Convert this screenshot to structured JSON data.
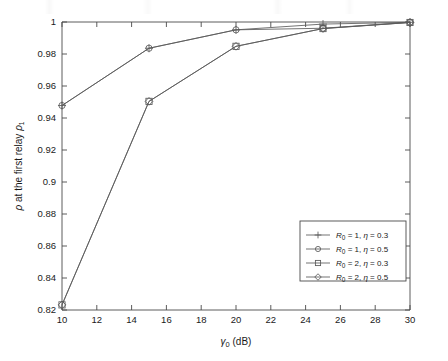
{
  "chart_data": {
    "type": "line",
    "title": "",
    "subtitle": "",
    "xlabel": "γ₀ (dB)",
    "xlabel_symbol": "γ",
    "xlabel_sub": "0",
    "xlabel_unit": "(dB)",
    "ylabel": "ρ at the first relay ρ₁",
    "ylabel_symbol": "ρ",
    "ylabel_text": " at the first relay ",
    "ylabel_symbol2": "ρ",
    "ylabel_sub2": "1",
    "xlim": [
      10,
      30
    ],
    "ylim": [
      0.82,
      1.0
    ],
    "xticks": [
      10,
      12,
      14,
      16,
      18,
      20,
      22,
      24,
      26,
      28,
      30
    ],
    "yticks": [
      0.82,
      0.84,
      0.86,
      0.88,
      0.9,
      0.92,
      0.94,
      0.96,
      0.98,
      1
    ],
    "xticklabels": [
      "10",
      "12",
      "14",
      "16",
      "18",
      "20",
      "22",
      "24",
      "26",
      "28",
      "30"
    ],
    "yticklabels": [
      "0.82",
      "0.84",
      "0.86",
      "0.88",
      "0.9",
      "0.92",
      "0.94",
      "0.96",
      "0.98",
      "1"
    ],
    "grid": false,
    "legend_position": "lower right",
    "line_color": "#5a5a5a",
    "x": [
      10,
      15,
      20,
      25,
      30
    ],
    "series": [
      {
        "name": "R_0 = 1, η = 0.3",
        "marker": "plus",
        "values": [
          0.9478,
          0.9836,
          0.9951,
          0.9987,
          0.9998
        ]
      },
      {
        "name": "R_0 = 1, η = 0.5",
        "marker": "circle",
        "values": [
          0.9478,
          0.9836,
          0.9951,
          0.9961,
          0.9998
        ]
      },
      {
        "name": "R_0 = 2, η = 0.3",
        "marker": "square",
        "values": [
          0.8232,
          0.9504,
          0.9848,
          0.9959,
          0.9997
        ]
      },
      {
        "name": "R_0 = 2, η = 0.5",
        "marker": "diamond",
        "values": [
          0.8232,
          0.9504,
          0.9848,
          0.9959,
          0.9997
        ]
      }
    ],
    "legend": [
      {
        "label_prefix": "R",
        "label_sub": "0",
        "label_mid": " = 1, ",
        "label_eta": "η",
        "label_suffix": " = 0.3",
        "marker": "plus"
      },
      {
        "label_prefix": "R",
        "label_sub": "0",
        "label_mid": " = 1, ",
        "label_eta": "η",
        "label_suffix": " = 0.5",
        "marker": "circle"
      },
      {
        "label_prefix": "R",
        "label_sub": "0",
        "label_mid": " = 2, ",
        "label_eta": "η",
        "label_suffix": " = 0.3",
        "marker": "square"
      },
      {
        "label_prefix": "R",
        "label_sub": "0",
        "label_mid": " = 2, ",
        "label_eta": "η",
        "label_suffix": " = 0.5",
        "marker": "diamond"
      }
    ]
  }
}
